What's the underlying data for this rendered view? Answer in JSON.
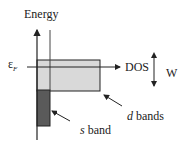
{
  "labels": {
    "energy": "Energy",
    "fermi": "ε",
    "fermi_sub": "F",
    "dos": "DOS",
    "width": "W",
    "d_bands_italic": "d",
    "d_bands_rest": " bands",
    "s_band_italic": "s",
    "s_band_rest": " band"
  },
  "colors": {
    "line": "#222222",
    "d_band_fill": "#d9d9d9",
    "s_band_fill": "#5a5a5a",
    "background": "#ffffff"
  }
}
